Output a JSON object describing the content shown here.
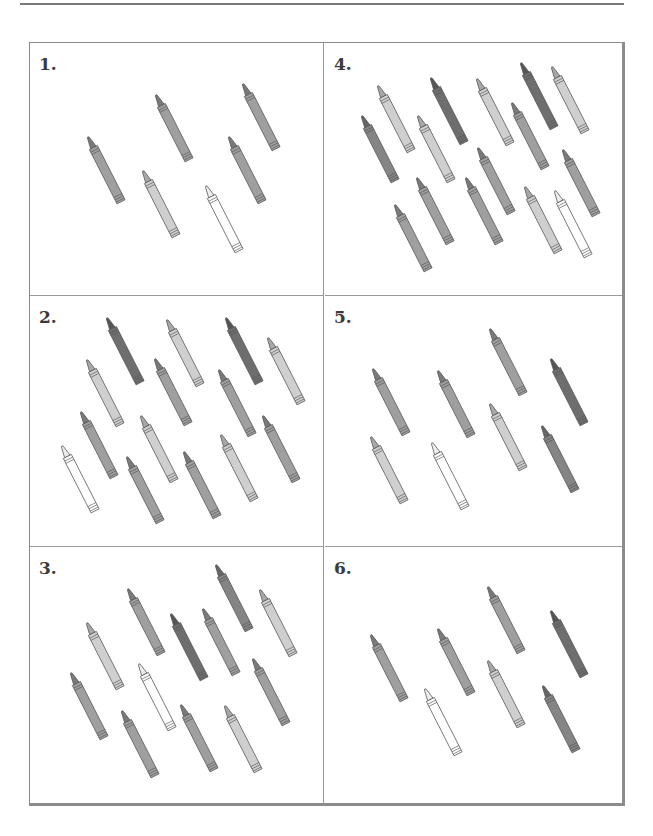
{
  "worksheet": {
    "title": "Count the crayons",
    "panels": [
      {
        "number": "1.",
        "crayon_count": 6,
        "crayons": [
          {
            "x": 50,
            "y": 92,
            "shade": "medium"
          },
          {
            "x": 118,
            "y": 50,
            "shade": "medium"
          },
          {
            "x": 205,
            "y": 39,
            "shade": "medium"
          },
          {
            "x": 105,
            "y": 126,
            "shade": "light"
          },
          {
            "x": 191,
            "y": 92,
            "shade": "medium"
          },
          {
            "x": 168,
            "y": 141,
            "shade": "white"
          }
        ]
      },
      {
        "number": "2.",
        "crayon_count": 14,
        "crayons": [
          {
            "x": 69,
            "y": 20,
            "shade": "dark"
          },
          {
            "x": 129,
            "y": 22,
            "shade": "light"
          },
          {
            "x": 188,
            "y": 20,
            "shade": "dark"
          },
          {
            "x": 230,
            "y": 40,
            "shade": "light"
          },
          {
            "x": 49,
            "y": 62,
            "shade": "light"
          },
          {
            "x": 117,
            "y": 61,
            "shade": "medium"
          },
          {
            "x": 181,
            "y": 72,
            "shade": "medium"
          },
          {
            "x": 43,
            "y": 114,
            "shade": "medium"
          },
          {
            "x": 103,
            "y": 118,
            "shade": "light"
          },
          {
            "x": 225,
            "y": 118,
            "shade": "medium"
          },
          {
            "x": 24,
            "y": 148,
            "shade": "white"
          },
          {
            "x": 89,
            "y": 159,
            "shade": "medium"
          },
          {
            "x": 146,
            "y": 154,
            "shade": "medium"
          },
          {
            "x": 183,
            "y": 137,
            "shade": "light"
          }
        ]
      },
      {
        "number": "3.",
        "crayon_count": 12,
        "crayons": [
          {
            "x": 178,
            "y": 16,
            "shade": "medium-dark"
          },
          {
            "x": 90,
            "y": 40,
            "shade": "medium"
          },
          {
            "x": 222,
            "y": 41,
            "shade": "light"
          },
          {
            "x": 49,
            "y": 74,
            "shade": "light"
          },
          {
            "x": 133,
            "y": 65,
            "shade": "dark"
          },
          {
            "x": 165,
            "y": 60,
            "shade": "medium"
          },
          {
            "x": 101,
            "y": 115,
            "shade": "white"
          },
          {
            "x": 215,
            "y": 110,
            "shade": "medium"
          },
          {
            "x": 33,
            "y": 124,
            "shade": "medium"
          },
          {
            "x": 84,
            "y": 162,
            "shade": "medium"
          },
          {
            "x": 143,
            "y": 156,
            "shade": "medium"
          },
          {
            "x": 187,
            "y": 157,
            "shade": "light"
          }
        ]
      },
      {
        "number": "4.",
        "crayon_count": 15,
        "crayons": [
          {
            "x": 45,
            "y": 41,
            "shade": "light"
          },
          {
            "x": 98,
            "y": 33,
            "shade": "dark"
          },
          {
            "x": 144,
            "y": 34,
            "shade": "light"
          },
          {
            "x": 188,
            "y": 18,
            "shade": "dark"
          },
          {
            "x": 219,
            "y": 22,
            "shade": "light"
          },
          {
            "x": 29,
            "y": 71,
            "shade": "medium-dark"
          },
          {
            "x": 85,
            "y": 71,
            "shade": "light"
          },
          {
            "x": 179,
            "y": 58,
            "shade": "medium"
          },
          {
            "x": 145,
            "y": 103,
            "shade": "medium"
          },
          {
            "x": 230,
            "y": 105,
            "shade": "medium"
          },
          {
            "x": 84,
            "y": 133,
            "shade": "medium"
          },
          {
            "x": 133,
            "y": 133,
            "shade": "medium"
          },
          {
            "x": 62,
            "y": 160,
            "shade": "medium"
          },
          {
            "x": 192,
            "y": 142,
            "shade": "light"
          },
          {
            "x": 222,
            "y": 146,
            "shade": "white"
          }
        ]
      },
      {
        "number": "5.",
        "crayon_count": 8,
        "crayons": [
          {
            "x": 157,
            "y": 31,
            "shade": "medium"
          },
          {
            "x": 40,
            "y": 71,
            "shade": "medium"
          },
          {
            "x": 105,
            "y": 73,
            "shade": "medium"
          },
          {
            "x": 218,
            "y": 61,
            "shade": "dark"
          },
          {
            "x": 157,
            "y": 106,
            "shade": "light"
          },
          {
            "x": 38,
            "y": 139,
            "shade": "light"
          },
          {
            "x": 99,
            "y": 145,
            "shade": "white"
          },
          {
            "x": 209,
            "y": 128,
            "shade": "medium-dark"
          }
        ]
      },
      {
        "number": "6.",
        "crayon_count": 7,
        "crayons": [
          {
            "x": 155,
            "y": 38,
            "shade": "medium"
          },
          {
            "x": 218,
            "y": 62,
            "shade": "dark"
          },
          {
            "x": 38,
            "y": 86,
            "shade": "medium"
          },
          {
            "x": 105,
            "y": 80,
            "shade": "medium"
          },
          {
            "x": 155,
            "y": 112,
            "shade": "light"
          },
          {
            "x": 92,
            "y": 140,
            "shade": "white"
          },
          {
            "x": 210,
            "y": 137,
            "shade": "medium-dark"
          }
        ]
      }
    ]
  },
  "colors": {
    "border": "#8c8c8c",
    "divider": "#9a9a9a",
    "number_text": "#3a3a3a",
    "outline": "#555555",
    "shades": {
      "dark": {
        "body": "#6e6e6e",
        "tip": "#555555"
      },
      "medium-dark": {
        "body": "#858585",
        "tip": "#666666"
      },
      "medium": {
        "body": "#9f9f9f",
        "tip": "#7a7a7a"
      },
      "light": {
        "body": "#cfcfcf",
        "tip": "#a8a8a8"
      },
      "white": {
        "body": "#ffffff",
        "tip": "#eeeeee"
      }
    }
  }
}
